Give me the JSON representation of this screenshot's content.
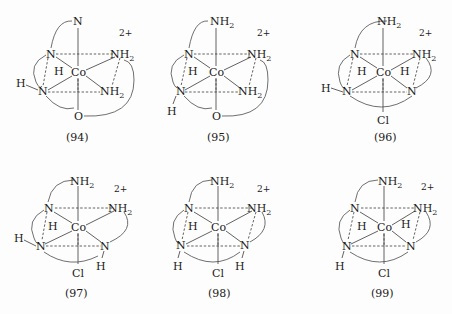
{
  "figure": {
    "charge": "2+",
    "metal": "Co",
    "structures": [
      {
        "number": "(94)",
        "atoms": {
          "top": "N",
          "upper_left": "N",
          "upper_right": "NH2",
          "lower_left": "N",
          "lower_right": "NH2",
          "bottom": "O"
        },
        "hydrogens": [
          "H (on upper-left N)",
          "H (on lower-left N)"
        ]
      },
      {
        "number": "(95)",
        "atoms": {
          "top": "NH2",
          "upper_left": "N",
          "upper_right": "NH2",
          "lower_left": "N",
          "lower_right": "NH2",
          "bottom": "O"
        },
        "hydrogens": [
          "H (on upper-left N)",
          "H (on lower-left N)"
        ]
      },
      {
        "number": "(96)",
        "atoms": {
          "top": "NH2",
          "upper_left": "N",
          "upper_right": "NH2",
          "lower_left": "N",
          "lower_right": "N",
          "bottom": "Cl"
        },
        "hydrogens": [
          "H (on upper-left N)",
          "H (on lower-left N)",
          "H (on lower-right N)"
        ]
      },
      {
        "number": "(97)",
        "atoms": {
          "top": "NH2",
          "upper_left": "N",
          "upper_right": "NH2",
          "lower_left": "N",
          "lower_right": "N",
          "bottom": "Cl"
        },
        "hydrogens": [
          "H (on upper-left N)",
          "H (on lower-left N)",
          "H (on lower-right N)"
        ]
      },
      {
        "number": "(98)",
        "atoms": {
          "top": "NH2",
          "upper_left": "N",
          "upper_right": "NH2",
          "lower_left": "N",
          "lower_right": "N",
          "bottom": "Cl"
        },
        "hydrogens": [
          "H (on upper-left N)",
          "H (on lower-left N)",
          "H (on lower-right N)"
        ]
      },
      {
        "number": "(99)",
        "atoms": {
          "top": "NH2",
          "upper_left": "N",
          "upper_right": "NH2",
          "lower_left": "N",
          "lower_right": "N",
          "bottom": "Cl"
        },
        "hydrogens": [
          "H (on upper-left N)",
          "H (on lower-left N)",
          "H (on lower-right N)"
        ]
      }
    ]
  },
  "text": {
    "N": "N",
    "NH": "NH",
    "sub2": "2",
    "H": "H",
    "Co": "Co",
    "O": "O",
    "Cl": "Cl",
    "charge": "2+",
    "labels": [
      "(94)",
      "(95)",
      "(96)",
      "(97)",
      "(98)",
      "(99)"
    ]
  }
}
